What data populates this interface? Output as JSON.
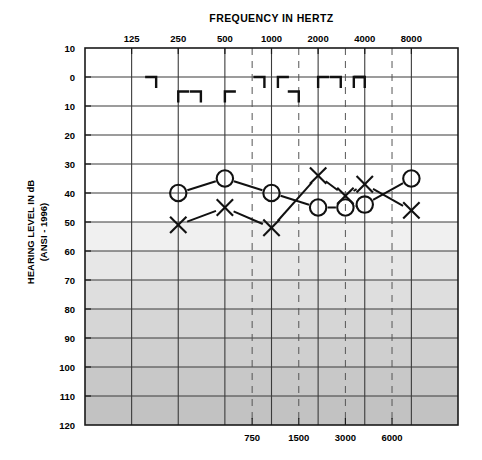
{
  "chart_data": {
    "type": "line",
    "title": "FREQUENCY IN HERTZ",
    "xlabel": "FREQUENCY IN HERTZ",
    "ylabel": "HEARING LEVEL IN dB",
    "ylabel_sub": "(ANSI - 1996)",
    "x_tick_labels": [
      "125",
      "250",
      "500",
      "1000",
      "2000",
      "4000",
      "8000"
    ],
    "x_tick_values": [
      125,
      250,
      500,
      1000,
      2000,
      4000,
      8000
    ],
    "x_half_octave_labels": [
      "750",
      "1500",
      "3000",
      "6000"
    ],
    "x_half_octave_values": [
      750,
      1500,
      3000,
      6000
    ],
    "y_tick_labels": [
      "10",
      "0",
      "10",
      "20",
      "30",
      "40",
      "50",
      "60",
      "70",
      "80",
      "90",
      "100",
      "110",
      "120"
    ],
    "y_tick_values": [
      -10,
      0,
      10,
      20,
      30,
      40,
      50,
      60,
      70,
      80,
      90,
      100,
      110,
      120
    ],
    "ylim": [
      -10,
      120
    ],
    "grid": true,
    "legend": "none",
    "series": [
      {
        "name": "Right ear air conduction",
        "symbol": "circle",
        "x": [
          250,
          500,
          1000,
          2000,
          3000,
          4000,
          8000
        ],
        "values": [
          40,
          35,
          40,
          45,
          45,
          44,
          35
        ]
      },
      {
        "name": "Left ear air conduction",
        "symbol": "X",
        "x": [
          250,
          500,
          1000,
          2000,
          3000,
          4000,
          8000
        ],
        "values": [
          51,
          45,
          52,
          34,
          41,
          37,
          46
        ]
      },
      {
        "name": "Bone conduction masked",
        "symbol": "bracket",
        "x": [
          180,
          250,
          350,
          500,
          900,
          1100,
          1500,
          2000,
          2800,
          3400,
          4000
        ],
        "values": [
          0,
          5,
          5,
          5,
          0,
          0,
          5,
          0,
          0,
          0,
          0
        ]
      }
    ]
  },
  "axes": {
    "x_title": "FREQUENCY IN HERTZ",
    "y_title_line1": "HEARING LEVEL IN dB",
    "y_title_line2": "(ANSI - 1996)"
  },
  "colors": {
    "frame": "#1a1a1a",
    "grid_major": "#3b3b3b",
    "grid_minor": "#6f6f6f",
    "dashed": "#555555",
    "marker": "#111111",
    "band_50": "#f0f0f0",
    "band_60": "#e7e7e7",
    "band_70": "#dedede",
    "band_80": "#d6d6d6",
    "band_90": "#cfcfcf",
    "band_100": "#c8c8c8",
    "band_110": "#c2c2c2"
  }
}
